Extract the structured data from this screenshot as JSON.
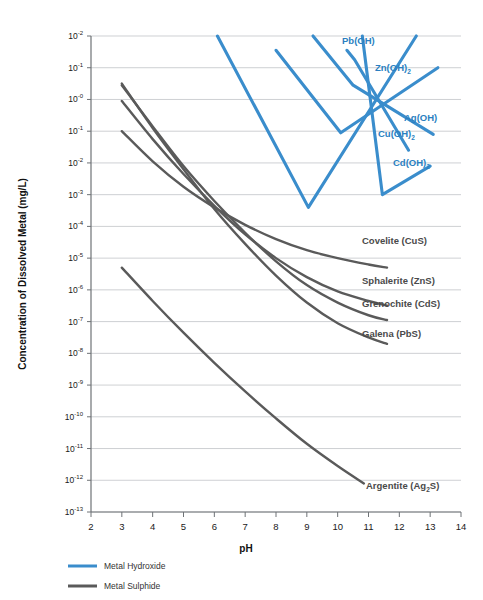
{
  "chart_data": {
    "type": "line",
    "title": "",
    "xlabel": "pH",
    "ylabel": "Concentration of Dissolved Metal (mg/L)",
    "xlim": [
      2,
      14
    ],
    "ylim_exponents": [
      -13,
      2
    ],
    "yscale": "log",
    "grid": true,
    "xticks": [
      "2",
      "3",
      "4",
      "5",
      "6",
      "7",
      "8",
      "9",
      "10",
      "11",
      "12",
      "13",
      "14"
    ],
    "yticks": [
      {
        "mantissa": "10",
        "exponent": "-2"
      },
      {
        "mantissa": "10",
        "exponent": "-1"
      },
      {
        "mantissa": "10",
        "exponent": "-0"
      },
      {
        "mantissa": "10",
        "exponent": "-1"
      },
      {
        "mantissa": "10",
        "exponent": "-2"
      },
      {
        "mantissa": "10",
        "exponent": "-3"
      },
      {
        "mantissa": "10",
        "exponent": "-4"
      },
      {
        "mantissa": "10",
        "exponent": "-5"
      },
      {
        "mantissa": "10",
        "exponent": "-6"
      },
      {
        "mantissa": "10",
        "exponent": "-7"
      },
      {
        "mantissa": "10",
        "exponent": "-8"
      },
      {
        "mantissa": "10",
        "exponent": "-9"
      },
      {
        "mantissa": "10",
        "exponent": "-10"
      },
      {
        "mantissa": "10",
        "exponent": "-11"
      },
      {
        "mantissa": "10",
        "exponent": "-12"
      },
      {
        "mantissa": "10",
        "exponent": "-13"
      }
    ],
    "legend": {
      "position": "bottom-left",
      "entries": [
        {
          "label": "Metal Hydroxide",
          "color": "#3a8dcc"
        },
        {
          "label": "Metal Sulphide",
          "color": "#5a5a5a"
        }
      ]
    },
    "series": [
      {
        "name": "Pb(OH)",
        "group": "Metal Hydroxide",
        "color": "#3a8dcc",
        "label": "Pb(OH)",
        "points": [
          [
            6.1,
            2
          ],
          [
            9.05,
            -3.4
          ],
          [
            12.55,
            2
          ]
        ]
      },
      {
        "name": "Zn(OH)2",
        "group": "Metal Hydroxide",
        "color": "#3a8dcc",
        "label": "Zn(OH)₂",
        "points": [
          [
            8.0,
            1.55
          ],
          [
            10.1,
            -1.05
          ],
          [
            13.25,
            1.0
          ]
        ]
      },
      {
        "name": "Ag(OH)",
        "group": "Metal Hydroxide",
        "color": "#3a8dcc",
        "label": "Ag(OH)",
        "points": [
          [
            9.2,
            2
          ],
          [
            10.5,
            0.45
          ],
          [
            13.1,
            -1.1
          ]
        ]
      },
      {
        "name": "Cu(OH)2",
        "group": "Metal Hydroxide",
        "color": "#3a8dcc",
        "label": "Cu(OH)₂",
        "points": [
          [
            10.3,
            1.55
          ],
          [
            10.55,
            1.25
          ],
          [
            12.3,
            -1.6
          ]
        ]
      },
      {
        "name": "Cd(OH)2",
        "group": "Metal Hydroxide",
        "color": "#3a8dcc",
        "label": "Cd(OH)₂",
        "points": [
          [
            10.8,
            2
          ],
          [
            11.45,
            -3.0
          ],
          [
            13.0,
            -2.1
          ]
        ]
      },
      {
        "name": "Covelite (CuS)",
        "group": "Metal Sulphide",
        "color": "#5a5a5a",
        "label": "Covelite (CuS)",
        "points": [
          [
            3.0,
            -1
          ],
          [
            4.0,
            -1.95
          ],
          [
            5.0,
            -2.75
          ],
          [
            6.0,
            -3.4
          ],
          [
            7.0,
            -3.95
          ],
          [
            8.0,
            -4.4
          ],
          [
            9.0,
            -4.75
          ],
          [
            10.0,
            -5.0
          ],
          [
            11.0,
            -5.2
          ],
          [
            11.6,
            -5.3
          ]
        ]
      },
      {
        "name": "Sphalerite (ZnS)",
        "group": "Metal Sulphide",
        "color": "#5a5a5a",
        "label": "Sphalerite (ZnS)",
        "points": [
          [
            3.0,
            -0.05
          ],
          [
            4.0,
            -1.25
          ],
          [
            5.0,
            -2.35
          ],
          [
            6.0,
            -3.35
          ],
          [
            7.0,
            -4.25
          ],
          [
            8.0,
            -5.0
          ],
          [
            9.0,
            -5.6
          ],
          [
            10.0,
            -6.05
          ],
          [
            11.0,
            -6.35
          ],
          [
            11.6,
            -6.5
          ]
        ]
      },
      {
        "name": "Grenochite (CdS)",
        "group": "Metal Sulphide",
        "color": "#5a5a5a",
        "label": "Grenochite (CdS)",
        "points": [
          [
            3.0,
            0.45
          ],
          [
            4.0,
            -0.85
          ],
          [
            5.0,
            -2.1
          ],
          [
            6.0,
            -3.2
          ],
          [
            7.0,
            -4.2
          ],
          [
            8.0,
            -5.1
          ],
          [
            9.0,
            -5.85
          ],
          [
            10.0,
            -6.4
          ],
          [
            11.0,
            -6.8
          ],
          [
            11.6,
            -6.95
          ]
        ]
      },
      {
        "name": "Galena (PbS)",
        "group": "Metal Sulphide",
        "color": "#5a5a5a",
        "label": "Galena (PbS)",
        "points": [
          [
            3.0,
            0.5
          ],
          [
            4.0,
            -0.9
          ],
          [
            5.0,
            -2.2
          ],
          [
            6.0,
            -3.45
          ],
          [
            7.0,
            -4.55
          ],
          [
            8.0,
            -5.55
          ],
          [
            9.0,
            -6.4
          ],
          [
            10.0,
            -7.05
          ],
          [
            11.0,
            -7.5
          ],
          [
            11.6,
            -7.7
          ]
        ]
      },
      {
        "name": "Argentite (Ag2S)",
        "group": "Metal Sulphide",
        "color": "#5a5a5a",
        "label": "Argentite (Ag₂S)",
        "points": [
          [
            3.0,
            -5.3
          ],
          [
            4.0,
            -6.35
          ],
          [
            5.0,
            -7.35
          ],
          [
            6.0,
            -8.3
          ],
          [
            7.0,
            -9.2
          ],
          [
            8.0,
            -10.05
          ],
          [
            9.0,
            -10.85
          ],
          [
            10.0,
            -11.55
          ],
          [
            10.85,
            -12.1
          ]
        ]
      }
    ],
    "annotations": [
      {
        "text": "Pb(OH)",
        "color": "#3a8dcc"
      },
      {
        "text": "Zn(OH)₂",
        "color": "#3a8dcc"
      },
      {
        "text": "Ag(OH)",
        "color": "#3a8dcc"
      },
      {
        "text": "Cu(OH)₂",
        "color": "#3a8dcc"
      },
      {
        "text": "Cd(OH)₂",
        "color": "#3a8dcc"
      },
      {
        "text": "Covelite (CuS)",
        "color": "#5a5a5a"
      },
      {
        "text": "Sphalerite (ZnS)",
        "color": "#5a5a5a"
      },
      {
        "text": "Grenochite (CdS)",
        "color": "#5a5a5a"
      },
      {
        "text": "Galena (PbS)",
        "color": "#5a5a5a"
      },
      {
        "text": "Argentite (Ag₂S)",
        "color": "#5a5a5a"
      }
    ]
  },
  "labels": {
    "y_axis_title": "Concentration of Dissolved Metal (mg/L)",
    "x_axis_title": "pH",
    "pb": "Pb(OH)",
    "zn_a": "Zn(OH)",
    "zn_b": "2",
    "ag": "Ag(OH)",
    "cu_a": "Cu(OH)",
    "cu_b": "2",
    "cd_a": "Cd(OH)",
    "cd_b": "2",
    "covelite": "Covelite (CuS)",
    "sphalerite": "Sphalerite (ZnS)",
    "grenochite": "Grenochite (CdS)",
    "galena": "Galena (PbS)",
    "argentite_a": "Argentite (Ag",
    "argentite_b": "2",
    "argentite_c": "S)",
    "legend_hydroxide": "Metal Hydroxide",
    "legend_sulphide": "Metal Sulphide"
  },
  "colors": {
    "blue": "#3a8dcc",
    "grey": "#5a5a5a",
    "grid": "#b9bcc0",
    "axis": "#6e7276",
    "text": "#1a1a1a"
  }
}
